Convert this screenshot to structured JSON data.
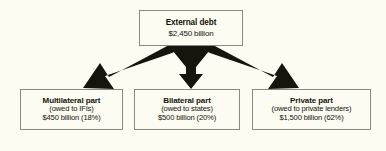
{
  "diagram": {
    "type": "flowchart",
    "background_color": "#fdfcf2",
    "box_border_color": "#8a8a80",
    "arrow_color": "#16140d",
    "text_color": "#14120c"
  },
  "root": {
    "title": "External debt",
    "amount": "$2,450 billion"
  },
  "branches": [
    {
      "title": "Multilateral part",
      "subtitle": "(owed to IFIs)",
      "amount": "$450 billion (18%)"
    },
    {
      "title": "Bilateral part",
      "subtitle": "(owed to states)",
      "amount": "$500 billion (20%)"
    },
    {
      "title": "Private part",
      "subtitle": "(owed to private lenders)",
      "amount": "$1,500 billion (62%)"
    }
  ],
  "arrows": [
    {
      "name": "arrow-to-multilateral",
      "direction": "down-left"
    },
    {
      "name": "arrow-to-bilateral",
      "direction": "down"
    },
    {
      "name": "arrow-to-private",
      "direction": "down-right"
    }
  ]
}
